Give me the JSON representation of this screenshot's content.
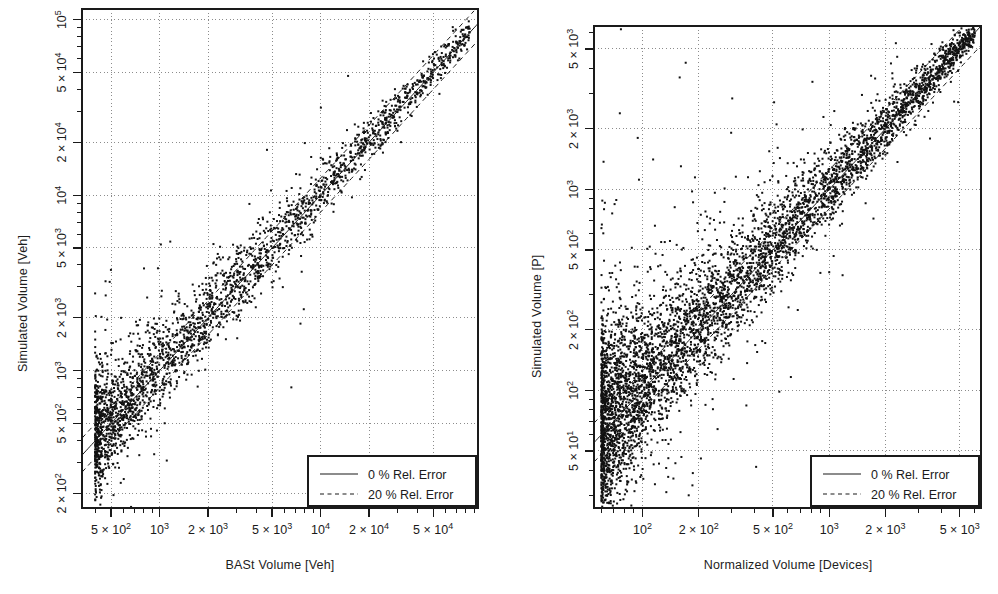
{
  "figure": {
    "background_color": "#ffffff",
    "ink_color": "#1a1a1a",
    "grid_color": "#8c8c8c",
    "panel_count": 2
  },
  "panels": [
    {
      "id": "left",
      "x_title": "BASt Volume [Veh]",
      "y_title": "Simulated Volume [Veh]",
      "legend": {
        "items": [
          {
            "label": "0 % Rel. Error",
            "style": "solid"
          },
          {
            "label": "20 % Rel. Error",
            "style": "dashed"
          }
        ]
      }
    },
    {
      "id": "right",
      "x_title": "Normalized Volume [Devices]",
      "y_title": "Simulated Volume [P]",
      "legend": {
        "items": [
          {
            "label": "0 % Rel. Error",
            "style": "solid"
          },
          {
            "label": "20 % Rel. Error",
            "style": "dashed"
          }
        ]
      }
    }
  ],
  "chart_data": [
    {
      "type": "scatter",
      "panel": "left",
      "title": "",
      "xlabel": "BASt Volume [Veh]",
      "ylabel": "Simulated Volume [Veh]",
      "xscale": "log",
      "yscale": "log",
      "xlim": [
        330,
        95000
      ],
      "ylim": [
        165,
        115000
      ],
      "grid": true,
      "grid_style": "dotted",
      "x_ticks": [
        500,
        1000,
        2000,
        5000,
        10000,
        20000,
        50000
      ],
      "x_tick_labels": [
        "5 × 10²",
        "10³",
        "2 × 10³",
        "5 × 10³",
        "10⁴",
        "2 × 10⁴",
        "5 × 10⁴"
      ],
      "y_ticks": [
        200,
        500,
        1000,
        2000,
        5000,
        10000,
        20000,
        50000,
        100000
      ],
      "y_tick_labels": [
        "2 × 10²",
        "5 × 10²",
        "10³",
        "2 × 10³",
        "5 × 10³",
        "10⁴",
        "2 × 10⁴",
        "5 × 10⁴",
        "10⁵"
      ],
      "reference_lines": [
        {
          "name": "0 % Rel. Error",
          "style": "solid",
          "relation": "y = x"
        },
        {
          "name": "+20 % Rel. Error",
          "style": "dashed",
          "relation": "y = 1.2x"
        },
        {
          "name": "-20 % Rel. Error",
          "style": "dashed",
          "relation": "y = 0.8x"
        }
      ],
      "point_count_approx": 2600,
      "point_color": "#111111",
      "point_size_px": 2,
      "description": "Dense band of points along the identity line from ~4×10² to ~8×10⁴ with increasing scatter at low volumes and a handful of far outliers below the band.",
      "legend_position": "bottom-right",
      "legend_entries": [
        "0 % Rel. Error",
        "20 % Rel. Error"
      ],
      "cloud": {
        "x_log_min": 2.6,
        "x_log_max": 4.93,
        "identity_slope": 1.0,
        "core_sigma_dex_at_low_x": 0.17,
        "core_sigma_dex_at_high_x": 0.035,
        "outlier_fraction": 0.05
      }
    },
    {
      "type": "scatter",
      "panel": "right",
      "title": "",
      "xlabel": "Normalized Volume [Devices]",
      "ylabel": "Simulated Volume [P]",
      "xscale": "log",
      "yscale": "log",
      "xlim": [
        55,
        6500
      ],
      "ylim": [
        26,
        6500
      ],
      "grid": true,
      "grid_style": "dotted",
      "x_ticks": [
        100,
        200,
        500,
        1000,
        2000,
        5000
      ],
      "x_tick_labels": [
        "10²",
        "2 × 10²",
        "5 × 10²",
        "10³",
        "2 × 10³",
        "5 × 10³"
      ],
      "y_ticks": [
        50,
        100,
        200,
        500,
        1000,
        2000,
        5000
      ],
      "y_tick_labels": [
        "5 × 10¹",
        "10²",
        "2 × 10²",
        "5 × 10²",
        "10³",
        "2 × 10³",
        "5 × 10³"
      ],
      "reference_lines": [
        {
          "name": "0 % Rel. Error",
          "style": "solid",
          "relation": "y = x"
        },
        {
          "name": "+20 % Rel. Error",
          "style": "dashed",
          "relation": "y = 1.2x"
        },
        {
          "name": "-20 % Rel. Error",
          "style": "dashed",
          "relation": "y = 0.8x"
        }
      ],
      "point_count_approx": 5200,
      "point_color": "#111111",
      "point_size_px": 2,
      "description": "Very dense cluster near 60-200 devices spreading widely upward, narrowing into a tight band along the identity line beyond ~5×10².",
      "legend_position": "bottom-right",
      "legend_entries": [
        "0 % Rel. Error",
        "20 % Rel. Error"
      ],
      "cloud": {
        "x_log_min": 1.78,
        "x_log_max": 3.78,
        "identity_slope": 1.0,
        "core_sigma_dex_at_low_x": 0.26,
        "core_sigma_dex_at_high_x": 0.03,
        "outlier_fraction": 0.06
      }
    }
  ]
}
